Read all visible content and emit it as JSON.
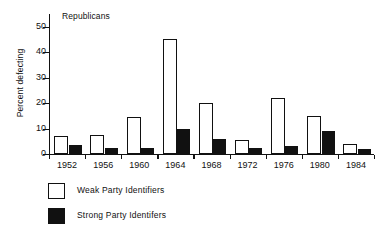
{
  "chart_data": {
    "type": "bar",
    "title": "Republicans",
    "xlabel": "",
    "ylabel": "Percent defecting",
    "categories": [
      "1952",
      "1956",
      "1960",
      "1964",
      "1968",
      "1972",
      "1976",
      "1980",
      "1984"
    ],
    "series": [
      {
        "name": "Weak Party Identifiers",
        "color": "#ffffff",
        "values": [
          7,
          7.5,
          14.5,
          45,
          20,
          5.5,
          22,
          15,
          4
        ]
      },
      {
        "name": "Strong Party Identifers",
        "color": "#111111",
        "values": [
          3.5,
          2.5,
          2.5,
          10,
          6,
          2.5,
          3,
          9,
          2
        ]
      }
    ],
    "ylim": [
      0,
      55
    ],
    "yticks": [
      0,
      10,
      20,
      30,
      40,
      50
    ],
    "ytick_labels": [
      "0",
      "10",
      "20",
      "30",
      "40",
      "50"
    ],
    "grid": false,
    "legend_position": "below-plot-left"
  },
  "legend": {
    "items": [
      {
        "label": "Weak Party Identifiers",
        "swatch": "open-square-swatch"
      },
      {
        "label": "Strong Party Identifers",
        "swatch": "filled-square-swatch"
      }
    ]
  }
}
